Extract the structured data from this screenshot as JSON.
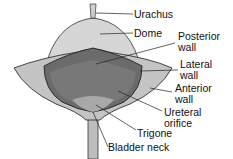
{
  "diagram": {
    "labels": {
      "urachus": "Urachus",
      "dome": "Dome",
      "posterior_wall_1": "Posterior",
      "posterior_wall_2": "wall",
      "lateral_wall_1": "Lateral",
      "lateral_wall_2": "wall",
      "anterior_wall_1": "Anterior",
      "anterior_wall_2": "wall",
      "ureteral_orifice_1": "Ureteral",
      "ureteral_orifice_2": "orifice",
      "trigone": "Trigone",
      "bladder_neck": "Bladder neck"
    },
    "colors": {
      "outer": "#c8c8c8",
      "dome": "#d9d9d9",
      "cavity": "#6e6e6e",
      "line": "#222222"
    }
  }
}
